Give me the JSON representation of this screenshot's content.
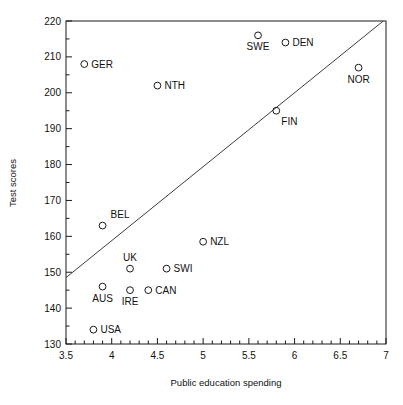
{
  "chart_data": {
    "type": "scatter",
    "title": "",
    "xlabel": "Public education spending",
    "ylabel": "Test scores",
    "xlim": [
      3.5,
      7.0
    ],
    "ylim": [
      130,
      220
    ],
    "xticks": [
      "3.5",
      "4",
      "4.5",
      "5",
      "5.5",
      "6",
      "6.5",
      "7"
    ],
    "xtick_values": [
      3.5,
      4,
      4.5,
      5,
      5.5,
      6,
      6.5,
      7
    ],
    "yticks": [
      "130",
      "140",
      "150",
      "160",
      "170",
      "180",
      "190",
      "200",
      "210",
      "220"
    ],
    "ytick_values": [
      130,
      140,
      150,
      160,
      170,
      180,
      190,
      200,
      210,
      220
    ],
    "x_minor_step": 0.1,
    "y_minor_step": 5,
    "grid": false,
    "legend": false,
    "marker_style": "open-circle",
    "points": [
      {
        "label": "GER",
        "x": 3.7,
        "y": 208,
        "label_pos": "right"
      },
      {
        "label": "USA",
        "x": 3.8,
        "y": 134,
        "label_pos": "right"
      },
      {
        "label": "AUS",
        "x": 3.9,
        "y": 146,
        "label_pos": "below"
      },
      {
        "label": "BEL",
        "x": 3.9,
        "y": 163,
        "label_pos": "above-right"
      },
      {
        "label": "UK",
        "x": 4.2,
        "y": 151,
        "label_pos": "above"
      },
      {
        "label": "IRE",
        "x": 4.2,
        "y": 145,
        "label_pos": "below"
      },
      {
        "label": "CAN",
        "x": 4.4,
        "y": 145,
        "label_pos": "right"
      },
      {
        "label": "NTH",
        "x": 4.5,
        "y": 202,
        "label_pos": "right"
      },
      {
        "label": "SWI",
        "x": 4.6,
        "y": 151,
        "label_pos": "right"
      },
      {
        "label": "NZL",
        "x": 5.0,
        "y": 158.5,
        "label_pos": "right"
      },
      {
        "label": "SWE",
        "x": 5.6,
        "y": 216,
        "label_pos": "below"
      },
      {
        "label": "FIN",
        "x": 5.8,
        "y": 195,
        "label_pos": "below-right"
      },
      {
        "label": "DEN",
        "x": 5.9,
        "y": 214,
        "label_pos": "right"
      },
      {
        "label": "NOR",
        "x": 6.7,
        "y": 207,
        "label_pos": "below"
      }
    ],
    "fit_line": {
      "name": "regression-line",
      "x0": 3.5,
      "y0": 148.5,
      "x1": 6.97,
      "y1": 220
    }
  }
}
